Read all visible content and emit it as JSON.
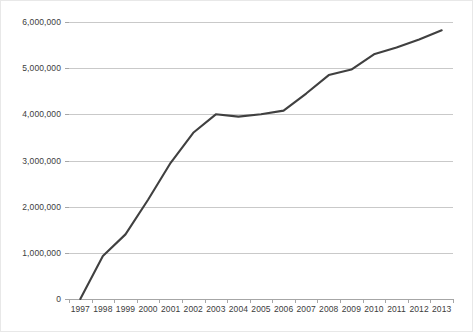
{
  "chart_data": {
    "type": "line",
    "title": "",
    "subtitle": "",
    "xlabel": "",
    "ylabel": "",
    "categories": [
      "1997",
      "1998",
      "1999",
      "2000",
      "2001",
      "2002",
      "2003",
      "2004",
      "2005",
      "2006",
      "2007",
      "2008",
      "2009",
      "2010",
      "2011",
      "2012",
      "2013"
    ],
    "series": [
      {
        "name": "",
        "color": "#404040",
        "values": [
          0,
          930000,
          1400000,
          2150000,
          2950000,
          3600000,
          4000000,
          3950000,
          4000000,
          4080000,
          4450000,
          4850000,
          4970000,
          5300000,
          5450000,
          5620000,
          5820000
        ]
      }
    ],
    "ylim": [
      0,
      6000000
    ],
    "ytick_values": [
      0,
      1000000,
      2000000,
      3000000,
      4000000,
      5000000,
      6000000
    ],
    "ytick_labels": [
      "0",
      "1,000,000",
      "2,000,000",
      "3,000,000",
      "4,000,000",
      "5,000,000",
      "6,000,000"
    ],
    "grid": true,
    "grid_axis": "y",
    "legend": "none",
    "legend_position": "none",
    "colors": {
      "line": "#404040",
      "gridline": "#c9c9c9",
      "axis": "#a6a6a6",
      "text": "#3c3c3c",
      "background": "#ffffff",
      "border": "#e8e8e8"
    }
  }
}
